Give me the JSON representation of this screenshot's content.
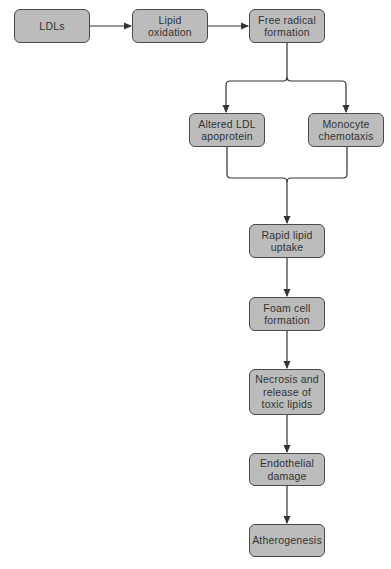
{
  "diagram": {
    "type": "flowchart",
    "colors": {
      "node_fill": "#bcbcbc",
      "node_border": "#4a4a4a",
      "text": "#333333",
      "connector": "#333333"
    },
    "nodes": [
      {
        "id": "ldls",
        "label": "LDLs"
      },
      {
        "id": "lipid_oxidation",
        "label": "Lipid\noxidation"
      },
      {
        "id": "free_radical",
        "label": "Free radical\nformation"
      },
      {
        "id": "altered_ldl",
        "label": "Altered LDL\napoprotein"
      },
      {
        "id": "monocyte",
        "label": "Monocyte\nchemotaxis"
      },
      {
        "id": "rapid_lipid",
        "label": "Rapid lipid\nuptake"
      },
      {
        "id": "foam_cell",
        "label": "Foam cell\nformation"
      },
      {
        "id": "necrosis",
        "label": "Necrosis and\nrelease of\ntoxic lipids"
      },
      {
        "id": "endothelial",
        "label": "Endothelial\ndamage"
      },
      {
        "id": "atherogenesis",
        "label": "Atherogenesis"
      }
    ],
    "edges": [
      {
        "from": "ldls",
        "to": "lipid_oxidation"
      },
      {
        "from": "lipid_oxidation",
        "to": "free_radical"
      },
      {
        "from": "free_radical",
        "to": "altered_ldl"
      },
      {
        "from": "free_radical",
        "to": "monocyte"
      },
      {
        "from": "altered_ldl",
        "to": "rapid_lipid"
      },
      {
        "from": "monocyte",
        "to": "rapid_lipid"
      },
      {
        "from": "rapid_lipid",
        "to": "foam_cell"
      },
      {
        "from": "foam_cell",
        "to": "necrosis"
      },
      {
        "from": "necrosis",
        "to": "endothelial"
      },
      {
        "from": "endothelial",
        "to": "atherogenesis"
      }
    ]
  }
}
